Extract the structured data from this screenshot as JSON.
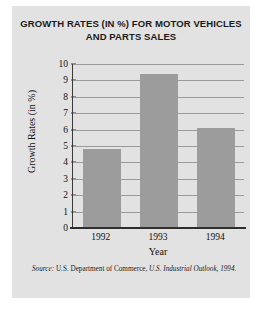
{
  "figure": {
    "title_line_1": "GROWTH RATES (IN %) FOR MOTOR VEHICLES",
    "title_line_2": "AND PARTS SALES",
    "panel_color": "#e2e2e2",
    "bar_color": "#9c9c9c",
    "axis_color": "#2e2e2e",
    "gridline_color": "#9a9a9a"
  },
  "source": {
    "label": "Source:",
    "body": " U.S. Department of Commerce, ",
    "publication": "U.S. Industrial Outlook, 1994."
  },
  "chart_data": {
    "type": "bar",
    "title": "GROWTH RATES (IN %) FOR MOTOR VEHICLES AND PARTS SALES",
    "xlabel": "Year",
    "ylabel": "Growth Rates (in %)",
    "categories": [
      "1992",
      "1993",
      "1994"
    ],
    "values": [
      4.8,
      9.4,
      6.1
    ],
    "ylim": [
      0,
      10
    ],
    "yticks": [
      0,
      1,
      2,
      3,
      4,
      5,
      6,
      7,
      8,
      9,
      10
    ],
    "ytick_labels": [
      "0",
      "1",
      "2",
      "3",
      "4",
      "5",
      "6",
      "7",
      "8",
      "9",
      "10"
    ],
    "grid": true,
    "legend": false
  }
}
